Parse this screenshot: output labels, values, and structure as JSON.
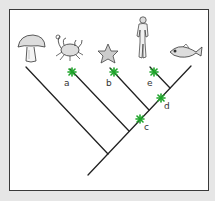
{
  "diagram": {
    "type": "cladogram",
    "taxa": [
      {
        "name": "mushroom",
        "icon": "mushroom-icon"
      },
      {
        "name": "crab",
        "icon": "crab-icon"
      },
      {
        "name": "starfish",
        "icon": "starfish-icon"
      },
      {
        "name": "human",
        "icon": "human-icon"
      },
      {
        "name": "fish",
        "icon": "fish-icon"
      }
    ],
    "markers": [
      {
        "label": "a",
        "on": "crab branch"
      },
      {
        "label": "b",
        "on": "starfish branch"
      },
      {
        "label": "e",
        "on": "human branch"
      },
      {
        "label": "d",
        "on": "trunk between starfish and human nodes"
      },
      {
        "label": "c",
        "on": "trunk between crab and starfish nodes"
      }
    ],
    "marker_color": "#1ea52a",
    "line_color": "#222222"
  }
}
